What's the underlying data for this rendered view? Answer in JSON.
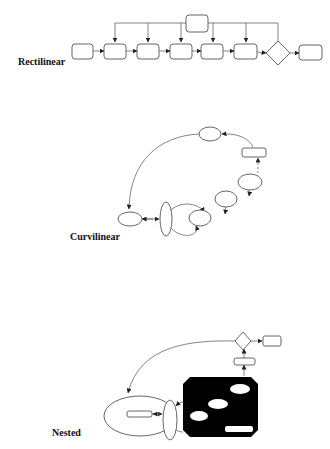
{
  "diagram": {
    "sections": [
      {
        "id": "rectilinear",
        "label": "Rectilinear"
      },
      {
        "id": "curvilinear",
        "label": "Curvilinear"
      },
      {
        "id": "nested",
        "label": "Nested"
      }
    ],
    "rectilinear": {
      "label": "Rectilinear",
      "nodes": [
        {
          "id": "top",
          "shape": "rounded-rect"
        },
        {
          "id": "r1",
          "shape": "rounded-rect"
        },
        {
          "id": "r2",
          "shape": "rounded-rect"
        },
        {
          "id": "r3",
          "shape": "rounded-rect"
        },
        {
          "id": "r4",
          "shape": "rounded-rect"
        },
        {
          "id": "r5",
          "shape": "rounded-rect"
        },
        {
          "id": "r6",
          "shape": "rounded-rect"
        },
        {
          "id": "decision",
          "shape": "diamond"
        },
        {
          "id": "r7",
          "shape": "rounded-rect"
        }
      ]
    },
    "curvilinear": {
      "label": "Curvilinear",
      "nodes": [
        {
          "id": "c-top",
          "shape": "ellipse"
        },
        {
          "id": "c-rect",
          "shape": "rect"
        },
        {
          "id": "c-e1",
          "shape": "ellipse"
        },
        {
          "id": "c-e2",
          "shape": "ellipse"
        },
        {
          "id": "c-e3",
          "shape": "ellipse"
        },
        {
          "id": "c-tall",
          "shape": "ellipse"
        },
        {
          "id": "c-left",
          "shape": "ellipse"
        }
      ]
    },
    "nested": {
      "label": "Nested",
      "nodes": [
        {
          "id": "n-decision",
          "shape": "diamond"
        },
        {
          "id": "n-out",
          "shape": "rounded-rect"
        },
        {
          "id": "n-small",
          "shape": "rounded-rect"
        },
        {
          "id": "n-container",
          "shape": "octagon",
          "fill": "#000000"
        },
        {
          "id": "n-tall",
          "shape": "ellipse"
        },
        {
          "id": "n-big",
          "shape": "ellipse"
        },
        {
          "id": "n-inner",
          "shape": "rounded-rect"
        }
      ]
    },
    "colors": {
      "stroke": "#555555",
      "container": "#000000",
      "background": "#ffffff"
    }
  }
}
